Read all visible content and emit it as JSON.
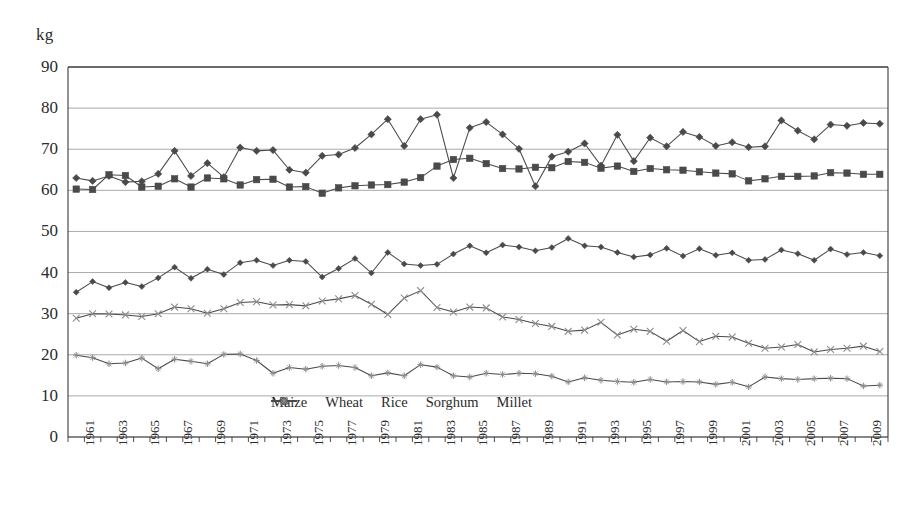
{
  "axis": {
    "unit_label": "kg",
    "y_ticks": [
      0,
      10,
      20,
      30,
      40,
      50,
      60,
      70,
      80,
      90
    ],
    "x_ticks": [
      "1961",
      "1963",
      "1965",
      "1967",
      "1969",
      "1971",
      "1973",
      "1975",
      "1977",
      "1979",
      "1981",
      "1983",
      "1985",
      "1987",
      "1989",
      "1991",
      "1993",
      "1995",
      "1997",
      "1999",
      "2001",
      "2003",
      "2005",
      "2007",
      "2009"
    ]
  },
  "legend": {
    "position": "bottom-center",
    "items": [
      {
        "label": "Maize",
        "marker": "diamond-filled-icon",
        "color": "#4a4a4a"
      },
      {
        "label": "Wheat",
        "marker": "diamond-small-icon",
        "color": "#4a4a4a"
      },
      {
        "label": "Rice",
        "marker": "square-filled-icon",
        "color": "#4a4a4a"
      },
      {
        "label": "Sorghum",
        "marker": "cross-x-icon",
        "color": "#5a5a5a"
      },
      {
        "label": "Millet",
        "marker": "star-icon",
        "color": "#5a5a5a"
      }
    ]
  },
  "colors": {
    "line": "#4a4a4a",
    "grid": "#8d8d8d",
    "axis": "#3a3a3a",
    "text": "#2b2b2b",
    "background": "#ffffff"
  },
  "chart_data": {
    "type": "line",
    "title": "",
    "xlabel": "",
    "ylabel": "kg",
    "ylim": [
      0,
      90
    ],
    "ytick_step": 10,
    "grid": true,
    "legend_position": "bottom-center",
    "x": [
      1961,
      1962,
      1963,
      1964,
      1965,
      1966,
      1967,
      1968,
      1969,
      1970,
      1971,
      1972,
      1973,
      1974,
      1975,
      1976,
      1977,
      1978,
      1979,
      1980,
      1981,
      1982,
      1983,
      1984,
      1985,
      1986,
      1987,
      1988,
      1989,
      1990,
      1991,
      1992,
      1993,
      1994,
      1995,
      1996,
      1997,
      1998,
      1999,
      2000,
      2001,
      2002,
      2003,
      2004,
      2005,
      2006,
      2007,
      2008,
      2009,
      2010
    ],
    "series": [
      {
        "name": "Maize",
        "marker": "diamond-filled-icon",
        "values": [
          63.0,
          62.3,
          63.5,
          62.0,
          62.2,
          64.0,
          69.6,
          63.5,
          66.6,
          63.2,
          70.4,
          69.6,
          69.8,
          65.0,
          64.3,
          68.4,
          68.7,
          70.3,
          73.6,
          77.3,
          70.8,
          77.3,
          78.4,
          63.0,
          75.2,
          76.6,
          73.6,
          70.1,
          61.0,
          68.2,
          69.4,
          71.4,
          66.0,
          73.5,
          67.1,
          72.8,
          70.7,
          74.2,
          73.0,
          70.8,
          71.7,
          70.5,
          70.7,
          77.0,
          74.5,
          72.4,
          76.0,
          75.7,
          76.4,
          76.2
        ]
      },
      {
        "name": "Wheat",
        "marker": "diamond-small-icon",
        "values": [
          35.2,
          37.8,
          36.3,
          37.6,
          36.6,
          38.7,
          41.3,
          38.6,
          40.8,
          39.5,
          42.4,
          43.0,
          41.7,
          43.0,
          42.7,
          38.9,
          41.0,
          43.4,
          39.9,
          44.9,
          42.1,
          41.7,
          42.0,
          44.5,
          46.5,
          44.8,
          46.7,
          46.2,
          45.3,
          46.1,
          48.3,
          46.5,
          46.2,
          44.9,
          43.8,
          44.3,
          45.9,
          44.0,
          45.8,
          44.2,
          44.8,
          43.0,
          43.2,
          45.5,
          44.6,
          43.0,
          45.7,
          44.4,
          44.9,
          44.1
        ]
      },
      {
        "name": "Rice",
        "marker": "square-filled-icon",
        "values": [
          60.3,
          60.2,
          63.8,
          63.6,
          60.8,
          61.0,
          62.8,
          60.8,
          63.0,
          62.8,
          61.3,
          62.6,
          62.7,
          60.8,
          60.9,
          59.3,
          60.6,
          61.1,
          61.3,
          61.4,
          62.0,
          63.1,
          65.9,
          67.5,
          67.8,
          66.5,
          65.3,
          65.2,
          65.6,
          65.5,
          67.0,
          66.8,
          65.4,
          65.9,
          64.6,
          65.3,
          65.0,
          64.9,
          64.5,
          64.2,
          64.0,
          62.3,
          62.8,
          63.4,
          63.4,
          63.5,
          64.3,
          64.2,
          63.9,
          63.9
        ]
      },
      {
        "name": "Sorghum",
        "marker": "cross-x-icon",
        "values": [
          28.9,
          30.0,
          29.9,
          29.7,
          29.3,
          30.0,
          31.6,
          31.2,
          30.1,
          31.2,
          32.7,
          32.9,
          32.1,
          32.2,
          31.9,
          33.1,
          33.6,
          34.4,
          32.3,
          29.8,
          33.8,
          35.6,
          31.5,
          30.4,
          31.6,
          31.4,
          29.2,
          28.6,
          27.6,
          26.9,
          25.7,
          26.0,
          27.9,
          24.8,
          26.2,
          25.7,
          23.3,
          25.9,
          23.2,
          24.5,
          24.3,
          22.8,
          21.6,
          21.9,
          22.5,
          20.7,
          21.3,
          21.6,
          22.1,
          20.8
        ]
      },
      {
        "name": "Millet",
        "marker": "star-icon",
        "values": [
          19.9,
          19.3,
          17.8,
          18.0,
          19.2,
          16.6,
          18.9,
          18.4,
          17.8,
          20.1,
          20.2,
          18.6,
          15.5,
          16.9,
          16.5,
          17.2,
          17.4,
          16.9,
          14.9,
          15.6,
          14.9,
          17.6,
          17.0,
          14.9,
          14.6,
          15.5,
          15.2,
          15.5,
          15.4,
          14.8,
          13.4,
          14.4,
          13.8,
          13.5,
          13.3,
          14.0,
          13.4,
          13.5,
          13.4,
          12.8,
          13.3,
          12.2,
          14.6,
          14.2,
          14.0,
          14.2,
          14.3,
          14.2,
          12.4,
          12.6
        ]
      }
    ]
  }
}
